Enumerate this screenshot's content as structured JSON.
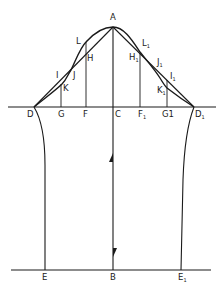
{
  "diagram": {
    "type": "sleeve-draft-pattern",
    "points": {
      "A": {
        "label": "A",
        "sub": ""
      },
      "B": {
        "label": "B",
        "sub": ""
      },
      "C": {
        "label": "C",
        "sub": ""
      },
      "D": {
        "label": "D",
        "sub": ""
      },
      "D1": {
        "label": "D",
        "sub": "1"
      },
      "E": {
        "label": "E",
        "sub": ""
      },
      "E1": {
        "label": "E",
        "sub": "1"
      },
      "F": {
        "label": "F",
        "sub": ""
      },
      "F1": {
        "label": "F",
        "sub": "1"
      },
      "G": {
        "label": "G",
        "sub": ""
      },
      "G1": {
        "label": "G1",
        "sub": ""
      },
      "H": {
        "label": "H",
        "sub": ""
      },
      "H1": {
        "label": "H",
        "sub": "1"
      },
      "I": {
        "label": "I",
        "sub": ""
      },
      "I1": {
        "label": "I",
        "sub": "1"
      },
      "J": {
        "label": "J",
        "sub": ""
      },
      "J1": {
        "label": "J",
        "sub": "1"
      },
      "K": {
        "label": "K",
        "sub": ""
      },
      "K1": {
        "label": "K",
        "sub": "1"
      },
      "L": {
        "label": "L",
        "sub": ""
      },
      "L1": {
        "label": "L",
        "sub": "1"
      }
    },
    "colors": {
      "line": "#1a1a1a",
      "background": "#ffffff"
    }
  }
}
